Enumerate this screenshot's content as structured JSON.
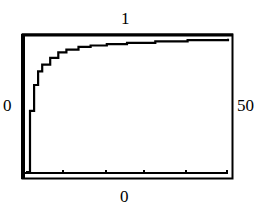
{
  "chart_data": {
    "type": "line",
    "title": "",
    "labels": {
      "top": "1",
      "left": "0",
      "right": "50",
      "bottom": "0"
    },
    "x": [
      0,
      1,
      2,
      3,
      4,
      6,
      8,
      10,
      13,
      16,
      20,
      25,
      32,
      40,
      50
    ],
    "values": [
      0.0,
      0.45,
      0.64,
      0.74,
      0.79,
      0.84,
      0.88,
      0.9,
      0.92,
      0.93,
      0.94,
      0.95,
      0.96,
      0.97,
      0.98
    ],
    "xlim": [
      0,
      50
    ],
    "ylim": [
      0,
      1
    ],
    "xlabel": "",
    "ylabel": "",
    "grid": false,
    "legend": null,
    "x_ticks_count": 5,
    "stroke_color": "#000000",
    "background": "#ffffff"
  }
}
